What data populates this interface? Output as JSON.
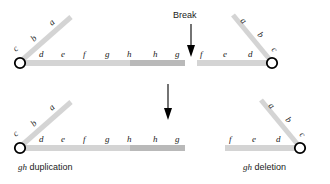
{
  "figure": {
    "colors": {
      "arm_light": "#d4d4d4",
      "arm_dark": "#b9b9b9",
      "centromere_fill": "#ffffff",
      "centromere_stroke": "#000000",
      "text": "#1a1a1a",
      "arrow": "#000000",
      "background": "#ffffff"
    }
  },
  "break_marker": {
    "label": "Break",
    "arrow": "down-arrow"
  },
  "transition_arrow": {
    "name": "down-arrow"
  },
  "top_left_chromosome": {
    "name": "top-left-chromosome",
    "centromere": "centromere",
    "short_arm_letters": [
      "c",
      "b",
      "a"
    ],
    "long_arm_letters": [
      "d",
      "e",
      "f",
      "g",
      "h",
      "h",
      "g"
    ]
  },
  "top_right_chromosome": {
    "name": "top-right-chromosome",
    "centromere": "centromere",
    "short_arm_letters": [
      "a",
      "b",
      "c"
    ],
    "long_arm_letters": [
      "f",
      "e",
      "d"
    ]
  },
  "bottom_left_chromosome": {
    "name": "duplication-product",
    "centromere": "centromere",
    "short_arm_letters": [
      "c",
      "b",
      "a"
    ],
    "long_arm_letters": [
      "d",
      "e",
      "f",
      "g",
      "h",
      "h",
      "g"
    ],
    "caption_italic": "gh",
    "caption_plain": " duplication"
  },
  "bottom_right_chromosome": {
    "name": "deletion-product",
    "centromere": "centromere",
    "short_arm_letters": [
      "a",
      "b",
      "c"
    ],
    "long_arm_letters": [
      "f",
      "e",
      "d"
    ],
    "caption_italic": "gh",
    "caption_plain": " deletion"
  }
}
